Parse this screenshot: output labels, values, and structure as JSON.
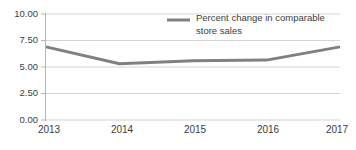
{
  "chart_data": {
    "type": "line",
    "title": "",
    "xlabel": "",
    "ylabel": "",
    "categories": [
      "2013",
      "2014",
      "2015",
      "2016",
      "2017"
    ],
    "series": [
      {
        "name": "Percent change in comparable store sales",
        "values": [
          6.9,
          5.3,
          5.6,
          5.65,
          6.9
        ],
        "color": "#808080"
      }
    ],
    "ylim": [
      0.0,
      10.0
    ],
    "yticks": [
      0.0,
      2.5,
      5.0,
      7.5,
      10.0
    ],
    "ytick_labels": [
      "0.00",
      "2.50",
      "5.00",
      "7.50",
      "10.00"
    ],
    "xtick_labels": [
      "2013",
      "2014",
      "2015",
      "2016",
      "2017"
    ],
    "grid": true,
    "grid_axis": "y",
    "legend_position": "top-center",
    "legend_entries": [
      {
        "label_line1": "Percent change in comparable",
        "label_line2": "store sales",
        "swatch_color": "#808080"
      }
    ],
    "colors": {
      "line": "#808080",
      "grid": "#d4d4d4",
      "axis": "#b5b5b5",
      "text": "#3c3c3c",
      "background": "#ffffff"
    }
  }
}
